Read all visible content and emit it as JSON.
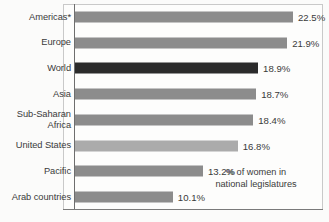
{
  "chart_data": {
    "type": "bar",
    "orientation": "horizontal",
    "title": "",
    "subtitle": "",
    "xlabel": "",
    "ylabel": "",
    "caption": "% of women in\nnational legislatures",
    "grid": false,
    "legend": "none",
    "xlim": [
      0,
      25.6
    ],
    "value_suffix": "%",
    "categories": [
      "Americas*",
      "Europe",
      "World",
      "Asia",
      "Sub-Saharan\nAfrica",
      "United States",
      "Pacific",
      "Arab countries"
    ],
    "values": [
      22.5,
      21.9,
      18.9,
      18.7,
      18.4,
      16.8,
      13.2,
      10.1
    ],
    "value_labels": [
      "22.5%",
      "21.9%",
      "18.9%",
      "18.7%",
      "18.4%",
      "16.8%",
      "13.2%",
      "10.1%"
    ],
    "bar_styles": [
      "default",
      "default",
      "highlight",
      "default",
      "default",
      "light",
      "default",
      "default"
    ],
    "colors": {
      "bar_default": "#8c8c8c",
      "bar_highlight": "#2b2b2b",
      "bar_light": "#ababab",
      "text": "#3a3a3a",
      "axis": "#6e6e6e",
      "frame": "#c9c9c9",
      "background": "#fdfdfc"
    }
  }
}
